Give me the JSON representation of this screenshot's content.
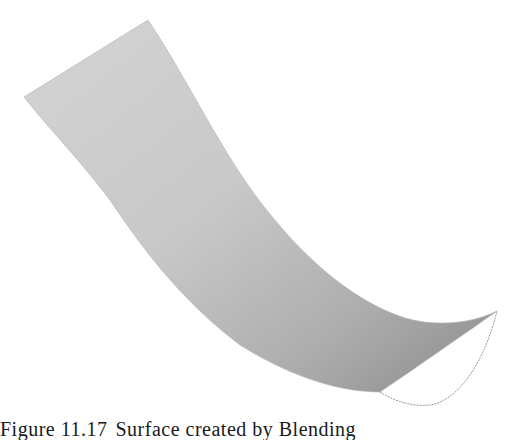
{
  "figure": {
    "label": "Figure 11.17",
    "caption_text": "Surface created by Blending",
    "colors": {
      "surface_light": "#d6d6d6",
      "surface_mid": "#bdbdbd",
      "surface_dark": "#8c8c8c",
      "edge_outline": "#9a9a9a",
      "background": "#ffffff"
    }
  }
}
